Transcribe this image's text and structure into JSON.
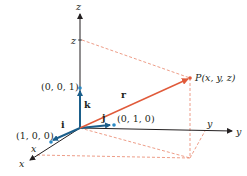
{
  "diagram": {
    "colors": {
      "axis": "#231f20",
      "basis": "#1b5e8a",
      "basis_point": "#2b8ac4",
      "vector": "#e05a3a",
      "dashed": "#e8846a"
    },
    "axes": {
      "x_label": "x",
      "y_label": "y",
      "z_label": "z"
    },
    "coordinate_marks": {
      "x_mark": "x",
      "y_mark": "y",
      "z_mark": "z"
    },
    "basis_vectors": {
      "i": "i",
      "j": "j",
      "k": "k"
    },
    "points": {
      "p100": "(1, 0, 0)",
      "p010": "(0, 1, 0)",
      "p001": "(0, 0, 1)",
      "P": "P(x, y, z)"
    },
    "vector_label": "r"
  }
}
